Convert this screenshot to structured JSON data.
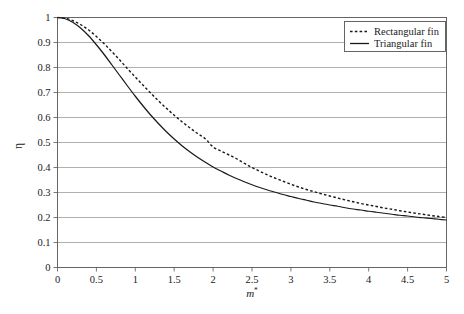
{
  "chart_data": {
    "type": "line",
    "title": "",
    "xlabel": "m*",
    "xlabel_base": "m",
    "xlabel_sup": "*",
    "ylabel": "η",
    "xlim": [
      0,
      5
    ],
    "ylim": [
      0,
      1
    ],
    "grid": "horizontal",
    "legend_position": "top-right",
    "xticks": [
      "0",
      "0.5",
      "1",
      "1.5",
      "2",
      "2.5",
      "3",
      "3.5",
      "4",
      "4.5",
      "5"
    ],
    "xtick_values": [
      0,
      0.5,
      1,
      1.5,
      2,
      2.5,
      3,
      3.5,
      4,
      4.5,
      5
    ],
    "yticks": [
      "0",
      "0.1",
      "0.2",
      "0.3",
      "0.4",
      "0.5",
      "0.6",
      "0.7",
      "0.8",
      "0.9",
      "1"
    ],
    "ytick_values": [
      0,
      0.1,
      0.2,
      0.3,
      0.4,
      0.5,
      0.6,
      0.7,
      0.8,
      0.9,
      1
    ],
    "x": [
      0,
      0.1,
      0.2,
      0.3,
      0.4,
      0.5,
      0.6,
      0.7,
      0.8,
      0.9,
      1.0,
      1.1,
      1.2,
      1.3,
      1.4,
      1.5,
      1.6,
      1.7,
      1.8,
      1.9,
      2.0,
      2.1,
      2.2,
      2.3,
      2.4,
      2.5,
      2.6,
      2.7,
      2.8,
      2.9,
      3.0,
      3.1,
      3.2,
      3.3,
      3.4,
      3.5,
      3.6,
      3.7,
      3.8,
      3.9,
      4.0,
      4.1,
      4.2,
      4.3,
      4.4,
      4.5,
      4.6,
      4.7,
      4.8,
      4.9,
      5.0
    ],
    "series": [
      {
        "name": "Rectangular fin",
        "style": "dashed",
        "color": "#1a1a1a",
        "values": [
          1.0,
          0.997,
          0.987,
          0.971,
          0.95,
          0.924,
          0.895,
          0.863,
          0.83,
          0.795,
          0.762,
          0.729,
          0.697,
          0.666,
          0.637,
          0.609,
          0.583,
          0.559,
          0.536,
          0.515,
          0.482,
          0.466,
          0.451,
          0.435,
          0.417,
          0.4,
          0.385,
          0.37,
          0.357,
          0.345,
          0.333,
          0.322,
          0.312,
          0.303,
          0.294,
          0.286,
          0.278,
          0.27,
          0.263,
          0.256,
          0.25,
          0.244,
          0.238,
          0.233,
          0.227,
          0.222,
          0.217,
          0.213,
          0.208,
          0.204,
          0.2
        ]
      },
      {
        "name": "Triangular fin",
        "style": "solid",
        "color": "#1a1a1a",
        "values": [
          1.0,
          0.995,
          0.98,
          0.957,
          0.927,
          0.891,
          0.852,
          0.81,
          0.768,
          0.726,
          0.685,
          0.646,
          0.609,
          0.575,
          0.543,
          0.514,
          0.487,
          0.463,
          0.441,
          0.421,
          0.402,
          0.386,
          0.37,
          0.356,
          0.343,
          0.331,
          0.32,
          0.31,
          0.301,
          0.292,
          0.284,
          0.276,
          0.269,
          0.262,
          0.256,
          0.25,
          0.245,
          0.239,
          0.234,
          0.23,
          0.225,
          0.221,
          0.217,
          0.213,
          0.209,
          0.206,
          0.202,
          0.199,
          0.196,
          0.193,
          0.19
        ]
      }
    ]
  },
  "legend": {
    "entries": [
      {
        "label": "Rectangular fin",
        "style": "dashed"
      },
      {
        "label": "Triangular fin",
        "style": "solid"
      }
    ]
  },
  "colors": {
    "background": "#ffffff",
    "grid": "#8c8c8c",
    "frame": "#555555",
    "line": "#1a1a1a",
    "text": "#1a1a1a"
  }
}
